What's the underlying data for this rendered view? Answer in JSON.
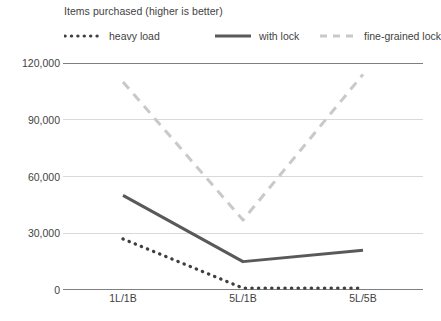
{
  "chart_data": {
    "type": "line",
    "title": "Items purchased (higher is better)",
    "xlabel": "",
    "ylabel": "",
    "categories": [
      "1L/1B",
      "5L/1B",
      "5L/5B"
    ],
    "ylim": [
      0,
      120000
    ],
    "yticks": [
      0,
      30000,
      60000,
      90000,
      120000
    ],
    "ytick_labels": [
      "0",
      "30,000",
      "60,000",
      "90,000",
      "120,000"
    ],
    "grid": true,
    "legend_position": "top",
    "series": [
      {
        "name": "heavy load",
        "values": [
          27000,
          1000,
          1000
        ],
        "style": "dotted",
        "color": "#3f3f3f"
      },
      {
        "name": "with lock",
        "values": [
          50000,
          15000,
          21000
        ],
        "style": "solid",
        "color": "#595959"
      },
      {
        "name": "fine-grained lock",
        "values": [
          110000,
          37000,
          114000
        ],
        "style": "dashed",
        "color": "#c9c9c9"
      }
    ]
  },
  "axis": {
    "axis_line_color": "#7f7f7f",
    "gridline_color": "#d9d9d9"
  }
}
